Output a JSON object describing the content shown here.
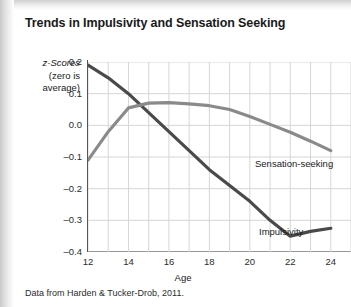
{
  "figure": {
    "title": "Trends in Impulsivity and Sensation Seeking",
    "source_note": "Data from Harden & Tucker-Drob, 2011.",
    "background_color": "#ffffff",
    "page_edge_color": "#d8d8d8"
  },
  "chart_data": {
    "type": "line",
    "title": "Trends in Impulsivity and Sensation Seeking",
    "xlabel": "Age",
    "ylabel": "z-Scores (zero is average)",
    "ylabel_line1": "z-Scores",
    "ylabel_line2": "(zero is",
    "ylabel_line3": "average)",
    "xlim": [
      12,
      25
    ],
    "ylim": [
      -0.4,
      0.2
    ],
    "grid": true,
    "grid_color": "#d6d6d6",
    "legend": "inline-labels",
    "x": [
      12,
      13,
      14,
      15,
      16,
      17,
      18,
      19,
      20,
      21,
      22,
      23,
      24
    ],
    "xticks": [
      12,
      14,
      16,
      18,
      20,
      22,
      24
    ],
    "yticks": [
      0.2,
      0.1,
      0.0,
      -0.1,
      -0.2,
      -0.3,
      -0.4
    ],
    "ytick_labels": [
      "0.2",
      "0.1",
      "0.0",
      "–0.1",
      "–0.2",
      "–0.3",
      "–0.4"
    ],
    "series": [
      {
        "name": "Impulsivity",
        "color": "#4a4a4a",
        "values": [
          0.19,
          0.15,
          0.1,
          0.04,
          -0.02,
          -0.08,
          -0.14,
          -0.19,
          -0.24,
          -0.3,
          -0.35,
          -0.335,
          -0.325
        ],
        "label_position": {
          "x": 24,
          "y": -0.325
        }
      },
      {
        "name": "Sensation-seeking",
        "color": "#8a8a8a",
        "values": [
          -0.11,
          -0.02,
          0.055,
          0.07,
          0.072,
          0.068,
          0.062,
          0.05,
          0.028,
          0.003,
          -0.022,
          -0.05,
          -0.08
        ],
        "label_position": {
          "x": 24,
          "y": -0.08
        }
      }
    ]
  }
}
